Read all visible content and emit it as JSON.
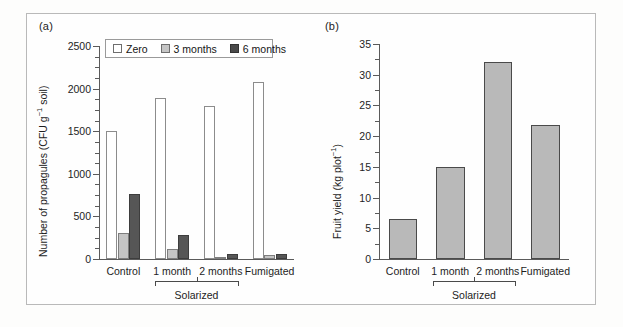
{
  "figure": {
    "panel_a_label": "(a)",
    "panel_b_label": "(b)"
  },
  "legend": {
    "items": [
      {
        "label": "Zero",
        "color": "#ffffff",
        "swatch": "zero"
      },
      {
        "label": "3 months",
        "color": "#c5c5c5",
        "swatch": "m3"
      },
      {
        "label": "6 months",
        "color": "#4a4a4a",
        "swatch": "m6"
      }
    ]
  },
  "group_bracket": {
    "label": "Solarized",
    "covers": [
      "1 month",
      "2 months"
    ]
  },
  "chart_data": [
    {
      "type": "bar",
      "panel": "(a)",
      "title": "",
      "xlabel": "",
      "ylabel": "Number of propagules (CFU g⁻¹ soil)",
      "ylabel_plain": "Number of propagules (CFU g-1 soil)",
      "categories": [
        "Control",
        "1 month",
        "2 months",
        "Fumigated"
      ],
      "series": [
        {
          "name": "Zero",
          "color": "#ffffff",
          "values": [
            1500,
            1890,
            1800,
            2080
          ]
        },
        {
          "name": "3 months",
          "color": "#c5c5c5",
          "values": [
            305,
            120,
            20,
            50
          ]
        },
        {
          "name": "6 months",
          "color": "#565656",
          "values": [
            760,
            285,
            60,
            62
          ]
        }
      ],
      "ylim": [
        0,
        2500
      ],
      "ytick_labels": [
        "0",
        "500",
        "1000",
        "1500",
        "2000",
        "2500"
      ],
      "ytick_values": [
        0,
        500,
        1000,
        1500,
        2000,
        2500
      ],
      "yminor_step": 125,
      "grid": false,
      "legend_position": "top-center"
    },
    {
      "type": "bar",
      "panel": "(b)",
      "title": "",
      "xlabel": "",
      "ylabel": "Fruit yield (kg plot⁻¹)",
      "ylabel_plain": "Fruit yield (kg plot-1)",
      "categories": [
        "Control",
        "1 month",
        "2 months",
        "Fumigated"
      ],
      "values": [
        6.5,
        15.0,
        32.0,
        21.8
      ],
      "series": [
        {
          "name": "Fruit yield",
          "color": "#b9b9b9",
          "values": [
            6.5,
            15.0,
            32.0,
            21.8
          ]
        }
      ],
      "ylim": [
        0,
        35
      ],
      "ytick_labels": [
        "0",
        "5",
        "10",
        "15",
        "20",
        "25",
        "30",
        "35"
      ],
      "ytick_values": [
        0,
        5,
        10,
        15,
        20,
        25,
        30,
        35
      ],
      "yminor_step": 2.5,
      "grid": false,
      "legend_position": "none"
    }
  ]
}
